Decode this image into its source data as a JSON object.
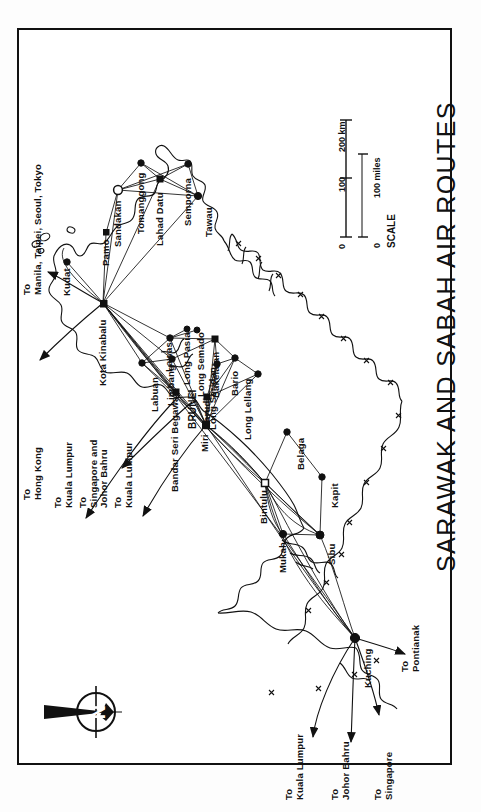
{
  "document": {
    "title": "SARAWAK AND SABAH AIR ROUTES",
    "type": "printed route map",
    "orientation": "rotated 90 degrees counter-clockwise"
  },
  "compass": {
    "name": "north-arrow",
    "letter": "N"
  },
  "scale": {
    "caption": "SCALE",
    "km_ticks": [
      "0",
      "100",
      "200 km"
    ],
    "mile_ticks": [
      "0",
      "100 miles"
    ]
  },
  "places": [
    {
      "name": "Kota Kinabalu",
      "x": 103,
      "y": 303,
      "kind": "hub",
      "lx": 98,
      "ly": 386
    },
    {
      "name": "Kudat",
      "x": 67,
      "y": 262,
      "kind": "city",
      "lx": 62,
      "ly": 296
    },
    {
      "name": "Pamo",
      "x": 106,
      "y": 233,
      "kind": "city",
      "lx": 101,
      "ly": 266
    },
    {
      "name": "Sandakan",
      "x": 118,
      "y": 190,
      "kind": "hub",
      "lx": 113,
      "ly": 247
    },
    {
      "name": "Tomanggong",
      "x": 141,
      "y": 163,
      "kind": "city",
      "lx": 136,
      "ly": 234
    },
    {
      "name": "Lahad Datu",
      "x": 160,
      "y": 179,
      "kind": "city",
      "lx": 155,
      "ly": 246
    },
    {
      "name": "Semporna",
      "x": 188,
      "y": 164,
      "kind": "city",
      "lx": 183,
      "ly": 226
    },
    {
      "name": "Tawau",
      "x": 198,
      "y": 196,
      "kind": "city",
      "lx": 204,
      "ly": 237
    },
    {
      "name": "Labuan",
      "x": 142,
      "y": 363,
      "kind": "city",
      "lx": 150,
      "ly": 412
    },
    {
      "name": "Lawas",
      "x": 170,
      "y": 338,
      "kind": "city",
      "lx": 164,
      "ly": 372
    },
    {
      "name": "Limbang",
      "x": 172,
      "y": 359,
      "kind": "city",
      "lx": 166,
      "ly": 406
    },
    {
      "name": "Long Pasia",
      "x": 187,
      "y": 329,
      "kind": "city",
      "lx": 182,
      "ly": 385
    },
    {
      "name": "Long Semado",
      "x": 197,
      "y": 330,
      "kind": "city",
      "lx": 196,
      "ly": 397
    },
    {
      "name": "Bakelalan",
      "x": 215,
      "y": 339,
      "kind": "city",
      "lx": 211,
      "ly": 398
    },
    {
      "name": "Bario",
      "x": 235,
      "y": 358,
      "kind": "city",
      "lx": 230,
      "ly": 396
    },
    {
      "name": "Long Lellang",
      "x": 258,
      "y": 374,
      "kind": "city",
      "lx": 243,
      "ly": 440
    },
    {
      "name": "Long Seridan",
      "x": 217,
      "y": 364,
      "kind": "city",
      "lx": 208,
      "ly": 430
    },
    {
      "name": "Marudi",
      "x": 207,
      "y": 397,
      "kind": "city",
      "lx": 202,
      "ly": 430
    },
    {
      "name": "BRUNEI",
      "x": 190,
      "y": 390,
      "kind": "country",
      "lx": 187,
      "ly": 429
    },
    {
      "name": "Bandar Seri Begawan",
      "x": 176,
      "y": 392,
      "kind": "capital",
      "lx": 170,
      "ly": 492
    },
    {
      "name": "Miri",
      "x": 206,
      "y": 425,
      "kind": "hub",
      "lx": 200,
      "ly": 452
    },
    {
      "name": "Bintulu",
      "x": 265,
      "y": 483,
      "kind": "hub",
      "lx": 259,
      "ly": 524
    },
    {
      "name": "Belaga",
      "x": 287,
      "y": 432,
      "kind": "city",
      "lx": 296,
      "ly": 470
    },
    {
      "name": "Kapit",
      "x": 322,
      "y": 477,
      "kind": "city",
      "lx": 330,
      "ly": 508
    },
    {
      "name": "Mukah",
      "x": 283,
      "y": 534,
      "kind": "city",
      "lx": 278,
      "ly": 573
    },
    {
      "name": "Sibu",
      "x": 320,
      "y": 535,
      "kind": "hub",
      "lx": 327,
      "ly": 565
    },
    {
      "name": "Kuching",
      "x": 355,
      "y": 638,
      "kind": "hub",
      "lx": 363,
      "ly": 688
    }
  ],
  "destinations": [
    {
      "label": "To\nManila, Taipei, Seoul, Tokyo",
      "lx": 22,
      "ly": 295,
      "ax1": 103,
      "ay1": 303,
      "ax2": 44,
      "ay2": 272
    },
    {
      "label": "To\nHong Kong",
      "lx": 22,
      "ly": 500,
      "ax1": 103,
      "ay1": 303,
      "ax2": 36,
      "ay2": 362
    },
    {
      "label": "To\nKuala Lumpur",
      "lx": 53,
      "ly": 508,
      "ax1": 180,
      "ay1": 395,
      "ax2": 82,
      "ay2": 521
    },
    {
      "label": "To\nSingapore and\nJohor Bahru",
      "lx": 78,
      "ly": 508,
      "ax1": 190,
      "ay1": 400,
      "ax2": 118,
      "ay2": 470
    },
    {
      "label": "To\nKuala Lumpur",
      "lx": 113,
      "ly": 508,
      "ax1": 206,
      "ay1": 425,
      "ax2": 140,
      "ay2": 518
    },
    {
      "label": "To\nKuala Lumpur",
      "lx": 284,
      "ly": 800,
      "ax1": 355,
      "ay1": 638,
      "ax2": 311,
      "ay2": 740
    },
    {
      "label": "To\nJohor Bahru",
      "lx": 330,
      "ly": 800,
      "ax1": 355,
      "ay1": 638,
      "ax2": 351,
      "ay2": 745
    },
    {
      "label": "To\nSingapore",
      "lx": 373,
      "ly": 800,
      "ax1": 355,
      "ay1": 638,
      "ax2": 380,
      "ay2": 718
    },
    {
      "label": "To\nPontianak",
      "lx": 400,
      "ly": 672,
      "ax1": 355,
      "ay1": 638,
      "ax2": 408,
      "ay2": 655
    }
  ]
}
